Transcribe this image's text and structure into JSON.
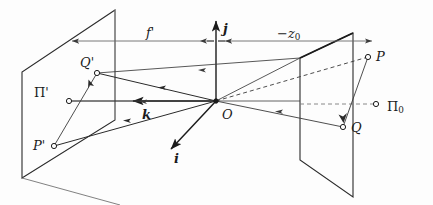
{
  "figure": {
    "type": "geometric-optics-projection-diagram",
    "background_color": "#fdfdfd",
    "ink_color": "#1b1b1b",
    "thin_line_color": "#555555",
    "labels": {
      "focal_length": "f",
      "focal_length_prime_mark": "'",
      "object_distance": "−z",
      "object_distance_sub": "0",
      "axis_j": "j",
      "axis_i": "i",
      "axis_k": "k",
      "origin": "O",
      "image_plane": "Π",
      "image_plane_prime": "'",
      "object_plane": "Π",
      "object_plane_sub": "0",
      "point_P": "P",
      "point_Q": "Q",
      "point_P_prime": "P",
      "point_P_prime_mark": "'",
      "point_Q_prime": "Q",
      "point_Q_prime_mark": "'"
    },
    "planes": [
      {
        "name": "image-plane",
        "label": "Π'",
        "corners": "115,10 22,72 22,178 115,120"
      },
      {
        "name": "object-plane",
        "label": "Π₀",
        "corners": "353,33 353,197 300,160 300,58"
      }
    ],
    "points": [
      {
        "name": "O",
        "x": 216,
        "y": 101,
        "label": "O"
      },
      {
        "name": "P",
        "x": 368,
        "y": 57,
        "label": "P"
      },
      {
        "name": "Q",
        "x": 343,
        "y": 127,
        "label": "Q"
      },
      {
        "name": "P-prime",
        "x": 54,
        "y": 146,
        "label": "P'"
      },
      {
        "name": "Q-prime",
        "x": 97,
        "y": 73,
        "label": "Q'"
      },
      {
        "name": "object-axis-point",
        "x": 376,
        "y": 104,
        "label": ""
      },
      {
        "name": "image-axis-point",
        "x": 69,
        "y": 101,
        "label": ""
      }
    ],
    "measurements": [
      {
        "name": "focal-length",
        "label": "f'",
        "from_x": 216,
        "to_x": 69,
        "y": 41
      },
      {
        "name": "object-distance",
        "label": "−z₀",
        "from_x": 216,
        "to_x": 375,
        "y": 41
      }
    ],
    "axes": [
      {
        "name": "j-axis",
        "label": "j",
        "direction": "up"
      },
      {
        "name": "i-axis",
        "label": "i",
        "direction": "down-left-front"
      },
      {
        "name": "k-axis",
        "label": "k",
        "direction": "left"
      }
    ]
  }
}
